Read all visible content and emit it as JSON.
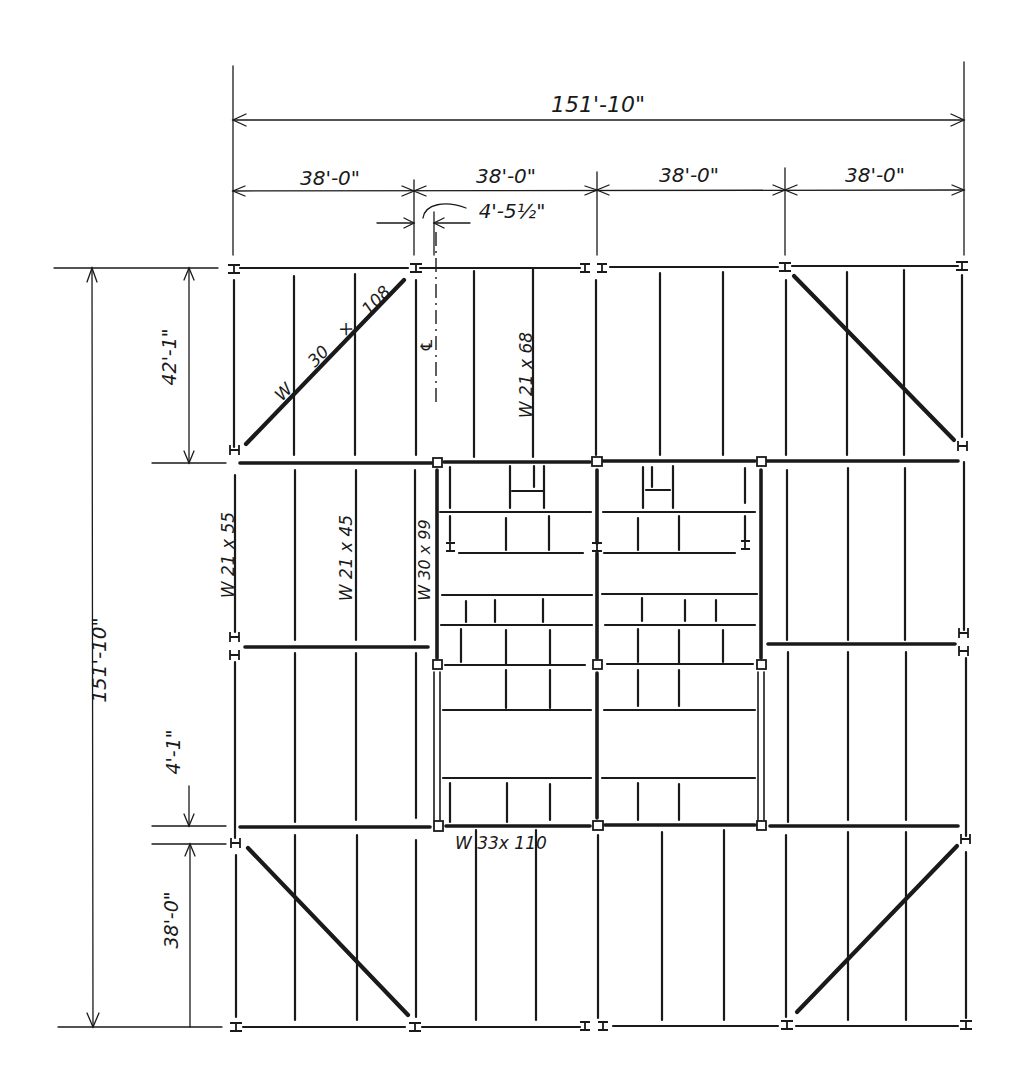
{
  "drawing": {
    "type": "structural framing plan",
    "colors": {
      "ink": "#1a1a1a",
      "paper": "#ffffff"
    }
  },
  "dimensions": {
    "overall_width": "151'-10\"",
    "bay_widths": [
      "38'-0\"",
      "38'-0\"",
      "38'-0\"",
      "38'-0\""
    ],
    "offset": "4'-5½\"",
    "overall_height": "151'-10\"",
    "top_bay_height": "42'-1\"",
    "gap": "4'-1\"",
    "bottom_bay_height": "38'-0\""
  },
  "member_labels": {
    "diagonal_top_left": [
      "W",
      "30",
      "×",
      "108"
    ],
    "center_line": "℄",
    "beam_top_center": "W 21 x 68",
    "girder_left": "W 21 x 55",
    "beam_left": "W 21 x 45",
    "girder_opening": "W 30 x 99",
    "girder_bottom": "W 33x 110"
  }
}
